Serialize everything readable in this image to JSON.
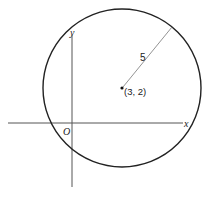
{
  "diagram": {
    "type": "circle-on-coordinate-plane",
    "axes": {
      "x_label": "x",
      "y_label": "y",
      "origin_label": "O"
    },
    "circle": {
      "center_label": "(3, 2)",
      "center": [
        3,
        2
      ],
      "radius": 5,
      "radius_label": "5"
    },
    "colors": {
      "stroke": "#222222",
      "axis": "#555555",
      "radius_line": "#666666",
      "background": "#ffffff"
    }
  }
}
